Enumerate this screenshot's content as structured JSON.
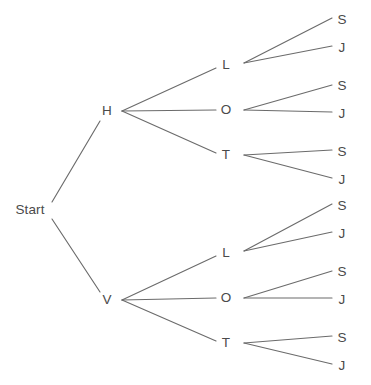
{
  "diagram": {
    "type": "tree",
    "line_color": "#6b6b6b",
    "text_color": "#4a4a4a",
    "background_color": "#ffffff",
    "nodes": [
      {
        "id": "start",
        "label": "Start",
        "x": 30,
        "y": 210,
        "level": 0
      },
      {
        "id": "h",
        "label": "H",
        "x": 107,
        "y": 111,
        "level": 1
      },
      {
        "id": "v",
        "label": "V",
        "x": 107,
        "y": 300,
        "level": 1
      },
      {
        "id": "h-l",
        "label": "L",
        "x": 226,
        "y": 65,
        "level": 2
      },
      {
        "id": "h-o",
        "label": "O",
        "x": 226,
        "y": 110,
        "level": 2
      },
      {
        "id": "h-t",
        "label": "T",
        "x": 226,
        "y": 155,
        "level": 2
      },
      {
        "id": "v-l",
        "label": "L",
        "x": 226,
        "y": 253,
        "level": 2
      },
      {
        "id": "v-o",
        "label": "O",
        "x": 226,
        "y": 298,
        "level": 2
      },
      {
        "id": "v-t",
        "label": "T",
        "x": 226,
        "y": 343,
        "level": 2
      },
      {
        "id": "h-l-s",
        "label": "S",
        "x": 342,
        "y": 20,
        "level": 3
      },
      {
        "id": "h-l-j",
        "label": "J",
        "x": 342,
        "y": 48,
        "level": 3
      },
      {
        "id": "h-o-s",
        "label": "S",
        "x": 342,
        "y": 86,
        "level": 3
      },
      {
        "id": "h-o-j",
        "label": "J",
        "x": 342,
        "y": 114,
        "level": 3
      },
      {
        "id": "h-t-s",
        "label": "S",
        "x": 342,
        "y": 152,
        "level": 3
      },
      {
        "id": "h-t-j",
        "label": "J",
        "x": 342,
        "y": 180,
        "level": 3
      },
      {
        "id": "v-l-s",
        "label": "S",
        "x": 342,
        "y": 206,
        "level": 3
      },
      {
        "id": "v-l-j",
        "label": "J",
        "x": 342,
        "y": 234,
        "level": 3
      },
      {
        "id": "v-o-s",
        "label": "S",
        "x": 342,
        "y": 272,
        "level": 3
      },
      {
        "id": "v-o-j",
        "label": "J",
        "x": 342,
        "y": 300,
        "level": 3
      },
      {
        "id": "v-t-s",
        "label": "S",
        "x": 342,
        "y": 338,
        "level": 3
      },
      {
        "id": "v-t-j",
        "label": "J",
        "x": 342,
        "y": 366,
        "level": 3
      }
    ],
    "edges": [
      {
        "from": "start",
        "to": "h",
        "x1": 52,
        "y1": 202,
        "x2": 100,
        "y2": 121
      },
      {
        "from": "start",
        "to": "v",
        "x1": 52,
        "y1": 219,
        "x2": 100,
        "y2": 292
      },
      {
        "from": "h",
        "to": "h-l",
        "x1": 122,
        "y1": 111,
        "x2": 216,
        "y2": 68
      },
      {
        "from": "h",
        "to": "h-o",
        "x1": 122,
        "y1": 111,
        "x2": 216,
        "y2": 110
      },
      {
        "from": "h",
        "to": "h-t",
        "x1": 122,
        "y1": 111,
        "x2": 216,
        "y2": 153
      },
      {
        "from": "v",
        "to": "v-l",
        "x1": 122,
        "y1": 300,
        "x2": 216,
        "y2": 256
      },
      {
        "from": "v",
        "to": "v-o",
        "x1": 122,
        "y1": 300,
        "x2": 216,
        "y2": 298
      },
      {
        "from": "v",
        "to": "v-t",
        "x1": 122,
        "y1": 300,
        "x2": 216,
        "y2": 341
      },
      {
        "from": "h-l",
        "to": "h-l-s",
        "x1": 244,
        "y1": 63,
        "x2": 332,
        "y2": 18
      },
      {
        "from": "h-l",
        "to": "h-l-j",
        "x1": 244,
        "y1": 63,
        "x2": 332,
        "y2": 46
      },
      {
        "from": "h-o",
        "to": "h-o-s",
        "x1": 244,
        "y1": 110,
        "x2": 332,
        "y2": 85
      },
      {
        "from": "h-o",
        "to": "h-o-j",
        "x1": 244,
        "y1": 110,
        "x2": 332,
        "y2": 112
      },
      {
        "from": "h-t",
        "to": "h-t-s",
        "x1": 244,
        "y1": 155,
        "x2": 332,
        "y2": 150
      },
      {
        "from": "h-t",
        "to": "h-t-j",
        "x1": 244,
        "y1": 155,
        "x2": 332,
        "y2": 178
      },
      {
        "from": "v-l",
        "to": "v-l-s",
        "x1": 244,
        "y1": 251,
        "x2": 332,
        "y2": 204
      },
      {
        "from": "v-l",
        "to": "v-l-j",
        "x1": 244,
        "y1": 251,
        "x2": 332,
        "y2": 232
      },
      {
        "from": "v-o",
        "to": "v-o-s",
        "x1": 244,
        "y1": 298,
        "x2": 332,
        "y2": 271
      },
      {
        "from": "v-o",
        "to": "v-o-j",
        "x1": 244,
        "y1": 298,
        "x2": 332,
        "y2": 298
      },
      {
        "from": "v-t",
        "to": "v-t-s",
        "x1": 244,
        "y1": 343,
        "x2": 332,
        "y2": 336
      },
      {
        "from": "v-t",
        "to": "v-t-j",
        "x1": 244,
        "y1": 343,
        "x2": 332,
        "y2": 364
      }
    ]
  }
}
